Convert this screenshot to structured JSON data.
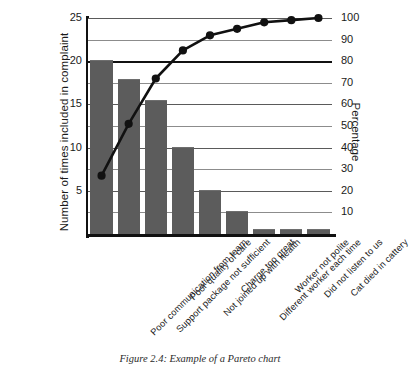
{
  "caption": "Figure 2.4: Example of a Pareto chart",
  "chart_data": {
    "type": "bar",
    "title": "",
    "subtitle": "",
    "xlabel": "",
    "ylabel": "Number of times included in complaint",
    "y2label": "Percentage",
    "ylim": [
      0,
      25
    ],
    "y2lim": [
      0,
      100
    ],
    "grid": true,
    "legend": "none",
    "categories": [
      "Poor communication from team",
      "Support package not sufficient",
      "Poor quality of care",
      "Not joined up with health",
      "Charge too great",
      "Different worker each time",
      "Worker not polite",
      "Did not listen to us",
      "Cat died in cattery"
    ],
    "series": [
      {
        "name": "Number of times included in complaint",
        "type": "bar",
        "axis": "left",
        "color": "#5c5c5c",
        "values": [
          20,
          17.8,
          15.4,
          10,
          5,
          2.5,
          0.5,
          0.5,
          0.5
        ]
      },
      {
        "name": "Cumulative percentage",
        "type": "line",
        "axis": "right",
        "color": "#111111",
        "values": [
          27,
          51,
          72,
          85,
          92,
          95,
          98,
          99,
          100
        ]
      }
    ],
    "ytick_labels": [
      "5",
      "10",
      "15",
      "20",
      "25"
    ],
    "ytick_values": [
      5,
      10,
      15,
      20,
      25
    ],
    "y2tick_labels": [
      "10",
      "20",
      "30",
      "40",
      "50",
      "60",
      "70",
      "80",
      "90",
      "100"
    ],
    "y2tick_values": [
      10,
      20,
      30,
      40,
      50,
      60,
      70,
      80,
      90,
      100
    ],
    "highlight_line": {
      "value": 80,
      "axis": "right",
      "style": "bold"
    }
  }
}
